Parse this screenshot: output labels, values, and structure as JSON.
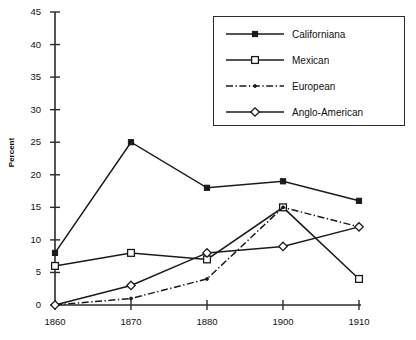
{
  "chart_data": {
    "type": "line",
    "title": "",
    "xlabel": "",
    "ylabel": "Percent",
    "categories": [
      "1860",
      "1870",
      "1880",
      "1900",
      "1910"
    ],
    "ylim": [
      0,
      45
    ],
    "ytick_step": 5,
    "yticks": [
      "0",
      "5",
      "10",
      "15",
      "20",
      "25",
      "30",
      "35",
      "40",
      "45"
    ],
    "grid": false,
    "legend_position": "top-right",
    "series": [
      {
        "name": "Californiana",
        "marker": "filled-square",
        "line": "solid",
        "values": [
          8,
          25,
          18,
          19,
          16
        ]
      },
      {
        "name": "Mexican",
        "marker": "open-square",
        "line": "solid",
        "values": [
          6,
          8,
          7,
          15,
          4
        ]
      },
      {
        "name": "European",
        "marker": "dot",
        "line": "dash-dot",
        "values": [
          0,
          1,
          4,
          15,
          12
        ]
      },
      {
        "name": "Anglo-American",
        "marker": "open-diamond",
        "line": "solid",
        "values": [
          0,
          3,
          8,
          9,
          12
        ]
      }
    ]
  },
  "legend": {
    "items": [
      {
        "label": "Californiana"
      },
      {
        "label": "Mexican"
      },
      {
        "label": "European"
      },
      {
        "label": "Anglo-American"
      }
    ]
  },
  "colors": {
    "axis": "#2b2b2b",
    "series": "#1a1a1a",
    "background": "#ffffff"
  },
  "caption": ""
}
